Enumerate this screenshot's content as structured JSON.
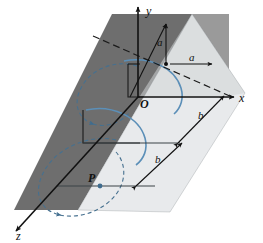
{
  "figure": {
    "name": "magnetic-field-around-wire-3d-diagram",
    "axes": {
      "x_label": "x",
      "y_label": "y",
      "z_label": "z",
      "origin_label": "O"
    },
    "points": {
      "p_label": "P"
    },
    "dimensions": {
      "a_vertical": "a",
      "a_horizontal": "a",
      "b_upper": "b",
      "b_lower": "b"
    },
    "colors": {
      "plane_dark": "#6e6e6e",
      "plane_medium": "#9a9a9a",
      "plane_light": "#e8eaec",
      "field_line": "#5b8fb8",
      "field_line_dashed": "#46708f",
      "axis": "#111111",
      "background": "#ffffff"
    },
    "elements": {
      "solid_arc_upper": "magnetic-field-arc-upper",
      "solid_arc_middle": "magnetic-field-arc-middle",
      "dashed_circle_upper": "magnetic-field-circle-upper-dashed",
      "dashed_circle_lower": "magnetic-field-circle-lower-dashed",
      "wire": "current-carrying-wire-dashed-diagonal"
    }
  }
}
